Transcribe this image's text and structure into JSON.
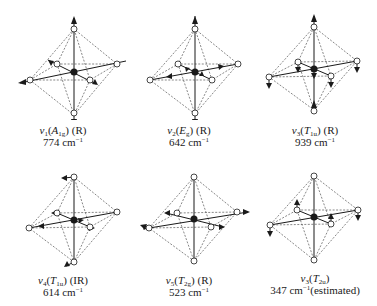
{
  "figure": {
    "colors": {
      "line": "#1a1a1a",
      "dash": "#555555",
      "background": "#ffffff"
    },
    "modes": [
      {
        "symbol": "ν",
        "index": "1",
        "species": "A",
        "species_sub": "1g",
        "activity": "(R)",
        "freq": "774",
        "unit": "cm",
        "unit_sup": "−1",
        "note": ""
      },
      {
        "symbol": "ν",
        "index": "2",
        "species": "E",
        "species_sub": "g",
        "activity": "(R)",
        "freq": "642",
        "unit": "cm",
        "unit_sup": "−1",
        "note": ""
      },
      {
        "symbol": "ν",
        "index": "3",
        "species": "T",
        "species_sub": "1u",
        "activity": "(R)",
        "freq": "939",
        "unit": "cm",
        "unit_sup": "−1",
        "note": ""
      },
      {
        "symbol": "ν",
        "index": "4",
        "species": "T",
        "species_sub": "1u",
        "activity": "(IR)",
        "freq": "614",
        "unit": "cm",
        "unit_sup": "−1",
        "note": ""
      },
      {
        "symbol": "ν",
        "index": "5",
        "species": "T",
        "species_sub": "2g",
        "activity": "(R)",
        "freq": "523",
        "unit": "cm",
        "unit_sup": "−1",
        "note": ""
      },
      {
        "symbol": "ν",
        "index": "3",
        "species": "T",
        "species_sub": "2u",
        "activity": "",
        "freq": "347",
        "unit": "cm",
        "unit_sup": "−1",
        "note": "(estimated)"
      }
    ]
  }
}
